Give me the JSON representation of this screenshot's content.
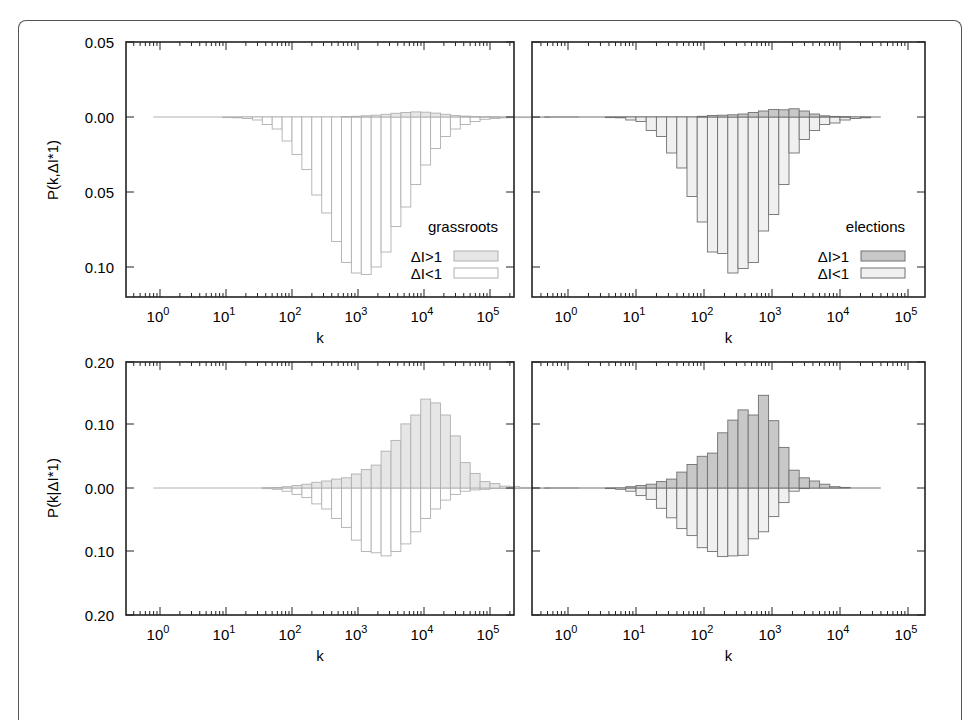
{
  "figure": {
    "panel_ylabels": {
      "top": "P(k,ΔI*1)",
      "bottom": "P(k|ΔI*1)"
    },
    "xlabel": "k",
    "xtick_labels": [
      {
        "base": "10",
        "exp": "0"
      },
      {
        "base": "10",
        "exp": "1"
      },
      {
        "base": "10",
        "exp": "2"
      },
      {
        "base": "10",
        "exp": "3"
      },
      {
        "base": "10",
        "exp": "4"
      },
      {
        "base": "10",
        "exp": "5"
      }
    ],
    "ytick_labels_top": [
      "0.05",
      "0.00",
      "0.05",
      "0.10"
    ],
    "ytick_labels_bottom": [
      "0.20",
      "0.10",
      "0.00",
      "0.10",
      "0.20"
    ],
    "legend": {
      "above_label": "ΔI>1",
      "below_label": "ΔI<1"
    },
    "colors": {
      "frame": "#222222",
      "outer_border": "#555555",
      "grassroots_above_fill": "#e6e6e6",
      "grassroots_below_fill": "#ffffff",
      "grassroots_edge": "#b0b0b0",
      "elections_above_fill": "#c8c8c8",
      "elections_below_fill": "#f0f0f0",
      "elections_edge": "#707070"
    }
  },
  "chart_data": [
    {
      "type": "bar",
      "panel": "top-left",
      "title": "grassroots",
      "xlabel": "k",
      "ylabel": "P(k,ΔI*1)",
      "xscale": "log",
      "xlim": [
        0.3,
        200000
      ],
      "ylim": [
        -0.12,
        0.05
      ],
      "ytick_values": [
        0.05,
        0.0,
        -0.05,
        -0.1
      ],
      "ytick_labels": [
        "0.05",
        "0.00",
        "0.05",
        "0.10"
      ],
      "legend_position": "lower right",
      "bin_log10_start": -0.1,
      "bin_log10_width": 0.15,
      "series": [
        {
          "name": "ΔI>1",
          "direction": "up",
          "values": [
            0,
            0,
            0,
            0,
            0,
            0,
            0,
            0,
            0,
            0,
            0,
            0,
            0,
            0,
            0,
            0,
            0,
            0,
            0,
            0.0003,
            0.0005,
            0.0008,
            0.0012,
            0.0018,
            0.0025,
            0.003,
            0.0034,
            0.0032,
            0.0026,
            0.0018,
            0.001,
            0.0006,
            0.0003,
            0.0002,
            0.0001,
            0,
            0,
            0,
            0,
            0,
            0,
            0,
            0
          ]
        },
        {
          "name": "ΔI<1",
          "direction": "down",
          "values": [
            0,
            0,
            0,
            0,
            0,
            0,
            0,
            0.0003,
            0.0005,
            0.001,
            0.002,
            0.005,
            0.008,
            0.016,
            0.025,
            0.035,
            0.052,
            0.064,
            0.083,
            0.097,
            0.104,
            0.105,
            0.1,
            0.09,
            0.073,
            0.06,
            0.045,
            0.032,
            0.021,
            0.013,
            0.008,
            0.005,
            0.003,
            0.0015,
            0.001,
            0.0005,
            0.0003,
            0.0002,
            0.0002,
            0.0001,
            0,
            0,
            0
          ]
        }
      ]
    },
    {
      "type": "bar",
      "panel": "top-right",
      "title": "elections",
      "xlabel": "k",
      "ylabel": "",
      "xscale": "log",
      "xlim": [
        0.3,
        200000
      ],
      "ylim": [
        -0.12,
        0.05
      ],
      "ytick_values": [
        0.05,
        0.0,
        -0.05,
        -0.1
      ],
      "legend_position": "lower right",
      "bin_log10_start": -0.35,
      "bin_log10_width": 0.15,
      "series": [
        {
          "name": "ΔI>1",
          "direction": "up",
          "values": [
            0,
            0,
            0,
            0,
            0,
            0,
            0,
            0,
            0,
            0,
            0,
            0,
            0,
            0,
            0,
            0.0005,
            0.001,
            0.0012,
            0.0015,
            0.002,
            0.003,
            0.004,
            0.005,
            0.0048,
            0.0055,
            0.004,
            0.002,
            0.0008,
            0.0004,
            0.0002,
            0,
            0,
            0
          ]
        },
        {
          "name": "ΔI<1",
          "direction": "down",
          "values": [
            0,
            0,
            0,
            0,
            0,
            0,
            0.0003,
            0.0005,
            0.002,
            0.003,
            0.009,
            0.013,
            0.024,
            0.034,
            0.053,
            0.07,
            0.09,
            0.091,
            0.104,
            0.101,
            0.097,
            0.076,
            0.065,
            0.045,
            0.024,
            0.015,
            0.009,
            0.005,
            0.004,
            0.002,
            0.001,
            0.0005,
            0
          ]
        }
      ]
    },
    {
      "type": "bar",
      "panel": "bottom-left",
      "title": "grassroots",
      "xlabel": "k",
      "ylabel": "P(k|ΔI*1)",
      "xscale": "log",
      "xlim": [
        0.3,
        200000
      ],
      "ylim": [
        -0.2,
        0.2
      ],
      "ytick_values": [
        0.2,
        0.1,
        0.0,
        -0.1,
        -0.2
      ],
      "ytick_labels": [
        "0.20",
        "0.10",
        "0.00",
        "0.10",
        "0.20"
      ],
      "bin_log10_start": -0.1,
      "bin_log10_width": 0.15,
      "series": [
        {
          "name": "ΔI>1",
          "direction": "up",
          "values": [
            0,
            0,
            0,
            0,
            0,
            0,
            0,
            0,
            0,
            0,
            0,
            0.0005,
            0.001,
            0.002,
            0.004,
            0.006,
            0.009,
            0.011,
            0.014,
            0.016,
            0.022,
            0.029,
            0.036,
            0.058,
            0.075,
            0.101,
            0.115,
            0.14,
            0.134,
            0.115,
            0.082,
            0.04,
            0.023,
            0.01,
            0.007,
            0.003,
            0.002,
            0.001,
            0.0005,
            0.0002,
            0,
            0,
            0
          ]
        },
        {
          "name": "ΔI<1",
          "direction": "down",
          "values": [
            0,
            0,
            0,
            0,
            0,
            0,
            0,
            0,
            0,
            0,
            0,
            0.001,
            0.002,
            0.005,
            0.01,
            0.015,
            0.025,
            0.033,
            0.048,
            0.062,
            0.082,
            0.1,
            0.102,
            0.107,
            0.1,
            0.088,
            0.069,
            0.048,
            0.033,
            0.019,
            0.01,
            0.005,
            0.003,
            0.002,
            0.001,
            0.0005,
            0.0003,
            0.0002,
            0.0001,
            0,
            0,
            0,
            0
          ]
        }
      ]
    },
    {
      "type": "bar",
      "panel": "bottom-right",
      "title": "elections",
      "xlabel": "k",
      "ylabel": "",
      "xscale": "log",
      "xlim": [
        0.3,
        200000
      ],
      "ylim": [
        -0.2,
        0.2
      ],
      "ytick_values": [
        0.2,
        0.1,
        0.0,
        -0.1,
        -0.2
      ],
      "bin_log10_start": -0.35,
      "bin_log10_width": 0.15,
      "series": [
        {
          "name": "ΔI>1",
          "direction": "up",
          "values": [
            0,
            0,
            0,
            0,
            0,
            0,
            0,
            0,
            0.002,
            0.004,
            0.006,
            0.01,
            0.014,
            0.025,
            0.037,
            0.05,
            0.055,
            0.087,
            0.107,
            0.123,
            0.115,
            0.146,
            0.106,
            0.064,
            0.028,
            0.016,
            0.011,
            0.006,
            0.002,
            0.001,
            0,
            0,
            0
          ]
        },
        {
          "name": "ΔI<1",
          "direction": "down",
          "values": [
            0,
            0,
            0,
            0,
            0,
            0,
            0.001,
            0.002,
            0.005,
            0.012,
            0.018,
            0.032,
            0.047,
            0.064,
            0.075,
            0.094,
            0.1,
            0.108,
            0.107,
            0.106,
            0.08,
            0.069,
            0.045,
            0.023,
            0.005,
            0.001,
            0,
            0,
            0,
            0,
            0,
            0,
            0
          ]
        }
      ]
    }
  ]
}
